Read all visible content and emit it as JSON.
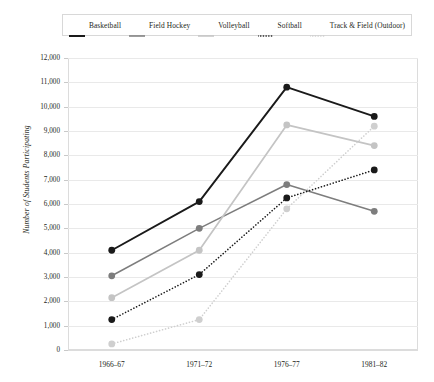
{
  "chart_data": {
    "type": "line",
    "title": "",
    "xlabel": "",
    "ylabel": "Number of Students Participating",
    "categories": [
      "1966–67",
      "1971–72",
      "1976–77",
      "1981–82"
    ],
    "ylim": [
      0,
      12000
    ],
    "ytick_step": 1000,
    "ytick_labels": [
      "12,000",
      "11,000",
      "10,000",
      "9,000",
      "8,000",
      "7,000",
      "6,000",
      "5,000",
      "4,000",
      "3,000",
      "2,000",
      "1,000",
      "0"
    ],
    "ytick_values": [
      12000,
      11000,
      10000,
      9000,
      8000,
      7000,
      6000,
      5000,
      4000,
      3000,
      2000,
      1000,
      0
    ],
    "grid": true,
    "legend_position": "top",
    "series": [
      {
        "name": "Basketball",
        "values": [
          4100,
          6100,
          10800,
          9600
        ],
        "color": "#1a1a1a",
        "style": "solid",
        "width": 1.9
      },
      {
        "name": "Field Hockey",
        "values": [
          3050,
          5000,
          6800,
          5700
        ],
        "color": "#7d7d7d",
        "style": "solid",
        "width": 1.5
      },
      {
        "name": "Volleyball",
        "values": [
          2150,
          4100,
          9250,
          8400
        ],
        "color": "#c4c4c4",
        "style": "solid",
        "width": 1.7
      },
      {
        "name": "Softball",
        "values": [
          1250,
          3100,
          6250,
          7400
        ],
        "color": "#1a1a1a",
        "style": "dotted",
        "width": 1.6
      },
      {
        "name": "Track & Field (Outdoor)",
        "values": [
          250,
          1250,
          5800,
          9200
        ],
        "color": "#cfcfcf",
        "style": "dotted",
        "width": 1.6
      }
    ]
  },
  "legend": {
    "items": [
      {
        "label": "Basketball"
      },
      {
        "label": "Field Hockey"
      },
      {
        "label": "Volleyball"
      },
      {
        "label": "Softball"
      },
      {
        "label": "Track & Field (Outdoor)"
      }
    ]
  }
}
